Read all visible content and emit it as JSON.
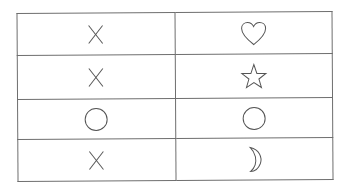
{
  "table": {
    "columns": 2,
    "rows": [
      {
        "left": "x",
        "right": "heart"
      },
      {
        "left": "x",
        "right": "star"
      },
      {
        "left": "circle",
        "right": "circle"
      },
      {
        "left": "x",
        "right": "crescent-moon"
      }
    ]
  },
  "colors": {
    "line": "#6e6e6e",
    "symbol": "#555555",
    "background": "#ffffff"
  }
}
